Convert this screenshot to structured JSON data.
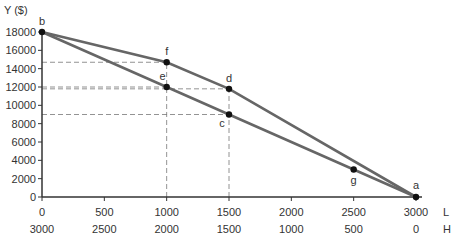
{
  "chart_data": {
    "type": "line",
    "title": "",
    "ylabel": "Y ($)",
    "xlabel_top": "L",
    "xlabel_bottom": "H",
    "ylim": [
      0,
      18000
    ],
    "xlim": [
      0,
      3000
    ],
    "y_ticks": [
      0,
      2000,
      4000,
      6000,
      8000,
      10000,
      12000,
      14000,
      16000,
      18000
    ],
    "x_ticks_L": [
      0,
      500,
      1000,
      1500,
      2000,
      2500,
      3000
    ],
    "x_ticks_H": [
      3000,
      2500,
      2000,
      1500,
      1000,
      500,
      0
    ],
    "grid": false,
    "series": [
      {
        "name": "upper constraint b-f-d-a",
        "points": [
          {
            "label": "b",
            "L": 0,
            "Y": 18000
          },
          {
            "label": "f",
            "L": 1000,
            "Y": 14700
          },
          {
            "label": "d",
            "L": 1500,
            "Y": 11800
          },
          {
            "label": "a",
            "L": 3000,
            "Y": 0
          }
        ]
      },
      {
        "name": "lower constraint b-e-c-g-a",
        "points": [
          {
            "label": "b",
            "L": 0,
            "Y": 18000
          },
          {
            "label": "e",
            "L": 1000,
            "Y": 12000
          },
          {
            "label": "c",
            "L": 1500,
            "Y": 9000
          },
          {
            "label": "g",
            "L": 2500,
            "Y": 3000
          },
          {
            "label": "a",
            "L": 3000,
            "Y": 0
          }
        ]
      }
    ],
    "dashed_guides": {
      "horizontal_Y": [
        14700,
        12000,
        11800,
        9000
      ],
      "vertical_L": [
        1000,
        1500
      ]
    }
  }
}
